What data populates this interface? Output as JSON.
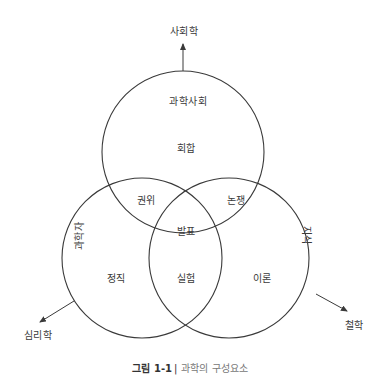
{
  "diagram": {
    "arrows": {
      "top": "사회학",
      "bottom_left": "심리학",
      "bottom_right": "철학"
    },
    "circles": {
      "top": {
        "title": "과학사회",
        "center": "회합"
      },
      "bottom_left": {
        "title": "과학자",
        "center": "정직"
      },
      "bottom_right": {
        "title": "지식",
        "center": "이론"
      }
    },
    "intersections": {
      "top_left": "권위",
      "top_right": "논쟁",
      "bottom": "실험",
      "center": "발표"
    },
    "colors": {
      "stroke": "#3a3a3a",
      "text": "#3a3a3a",
      "caption": "#777777"
    }
  },
  "caption": {
    "figure_number": "그림 1-1",
    "separator": "|",
    "title": "과학의 구성요소"
  }
}
